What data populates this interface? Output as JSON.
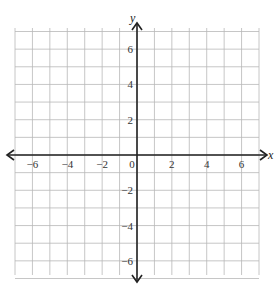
{
  "chart_data": {
    "type": "coordinate-plane",
    "title": "",
    "xlabel": "x",
    "ylabel": "y",
    "xlim": [
      -7,
      7
    ],
    "ylim": [
      -7,
      7
    ],
    "grid": true,
    "grid_step": 1,
    "x_ticks": [
      -6,
      -4,
      -2,
      0,
      2,
      4,
      6
    ],
    "y_ticks": [
      6,
      4,
      2,
      -2,
      -4,
      -6
    ],
    "x_tick_labels": [
      "−6",
      "−4",
      "−2",
      "0",
      "2",
      "4",
      "6"
    ],
    "y_tick_labels": [
      "6",
      "4",
      "2",
      "−2",
      "−4",
      "−6"
    ],
    "series": []
  },
  "axes": {
    "x_label": "x",
    "y_label": "y",
    "origin_label": "0"
  },
  "colors": {
    "grid": "#b8b8b8",
    "axis": "#222222",
    "text": "#333333"
  }
}
